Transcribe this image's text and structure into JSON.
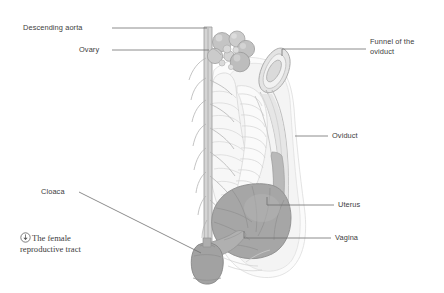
{
  "figure": {
    "title": "The female reproductive tract",
    "background_color": "#ffffff"
  },
  "caption": {
    "icon": "circled-arrow-icon",
    "text": "The female reproductive tract",
    "line_1": "The female",
    "line_2": "reproductive tract"
  },
  "labels": [
    {
      "id": "descending-aorta",
      "text": "Descending aorta",
      "side": "left",
      "x": 23,
      "y": 24,
      "leader": {
        "x1": 112,
        "y1": 28,
        "x2": 207,
        "y2": 28
      }
    },
    {
      "id": "ovary",
      "text": "Ovary",
      "side": "left",
      "x": 79,
      "y": 46,
      "leader": {
        "x1": 112,
        "y1": 50,
        "x2": 209,
        "y2": 50
      }
    },
    {
      "id": "funnel-of-the-oviduct",
      "text": "Funnel of the oviduct",
      "side": "right",
      "x": 370,
      "y": 38,
      "line_1": "Funnel of the",
      "line_2": "oviduct",
      "leader": {
        "x1": 282,
        "y1": 49,
        "x2": 366,
        "y2": 49
      }
    },
    {
      "id": "oviduct",
      "text": "Oviduct",
      "side": "right",
      "x": 332,
      "y": 132,
      "leader": {
        "x1": 295,
        "y1": 136,
        "x2": 328,
        "y2": 136
      }
    },
    {
      "id": "uterus",
      "text": "Uterus",
      "side": "right",
      "x": 338,
      "y": 202,
      "leader": {
        "x1": 267,
        "y1": 205,
        "x2": 334,
        "y2": 205
      }
    },
    {
      "id": "vagina",
      "text": "Vagina",
      "side": "right",
      "x": 335,
      "y": 234,
      "leader": {
        "x1": 244,
        "y1": 238,
        "x2": 331,
        "y2": 238
      }
    },
    {
      "id": "cloaca",
      "text": "Cloaca",
      "side": "left",
      "x": 41,
      "y": 188,
      "leader": {
        "x1": 79,
        "y1": 192,
        "x2": 201,
        "y2": 253
      }
    }
  ],
  "anatomy_parts": [
    {
      "id": "descending-aorta",
      "name": "Descending aorta",
      "color": "#9a9a9a"
    },
    {
      "id": "ovary-follicles",
      "name": "Ovary follicles",
      "color": "#c9c9c9"
    },
    {
      "id": "infundibulum",
      "name": "Funnel of the oviduct",
      "color": "#d8d8d8"
    },
    {
      "id": "oviduct",
      "name": "Oviduct",
      "color": "#efefef"
    },
    {
      "id": "uterus",
      "name": "Uterus",
      "color": "#a8a8a8"
    },
    {
      "id": "vagina",
      "name": "Vagina",
      "color": "#b4b4b4"
    },
    {
      "id": "cloaca",
      "name": "Cloaca",
      "color": "#a0a0a0"
    },
    {
      "id": "intestine",
      "name": "Intestine",
      "color": "#f4f4f4"
    }
  ],
  "colors": {
    "line": "#8f8f8f",
    "leader_line": "#6e6e6e",
    "text": "#3c3c3c",
    "outline": "#b8b8b8",
    "dark_tissue": "#a8a8a8",
    "mid_tissue": "#cfcfcf",
    "light_tissue": "#f2f2f2"
  }
}
